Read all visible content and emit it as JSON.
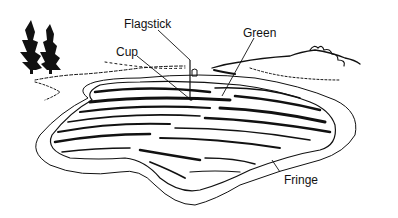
{
  "diagram": {
    "labels": {
      "flagstick": "Flagstick",
      "cup": "Cup",
      "green": "Green",
      "fringe": "Fringe"
    },
    "colors": {
      "ink": "#111111",
      "background": "#ffffff"
    }
  }
}
